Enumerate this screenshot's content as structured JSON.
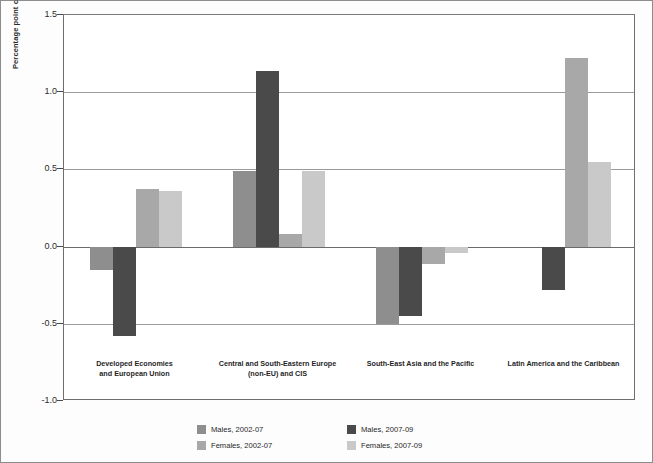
{
  "chart_data": {
    "type": "bar",
    "title": "",
    "subtitle": "",
    "xlabel": "",
    "ylabel": "Percentage point change in labour force participation rate",
    "ylim": [
      -1.0,
      1.5
    ],
    "yticks": [
      1.5,
      1.0,
      0.5,
      0.0,
      -0.5,
      -1.0
    ],
    "ytick_labels": [
      "1.5",
      "1.0",
      "0.5",
      "0.0",
      "-0.5",
      "-1.0"
    ],
    "grid": true,
    "legend_position": "bottom",
    "categories": [
      "Developed Economies\nand European Union",
      "Central and South-Eastern Europe\n(non-EU) and CIS",
      "South-East Asia and the Pacific",
      "Latin America and the Caribbean"
    ],
    "series": [
      {
        "name": "Males, 2002-07",
        "color": "#8e8e8e",
        "values": [
          -0.15,
          0.49,
          -0.5,
          0.0
        ]
      },
      {
        "name": "Males, 2007-09",
        "color": "#4a4a4a",
        "values": [
          -0.58,
          1.14,
          -0.45,
          -0.28
        ]
      },
      {
        "name": "Females, 2002-07",
        "color": "#a8a8a8",
        "values": [
          0.37,
          0.08,
          -0.11,
          1.22
        ]
      },
      {
        "name": "Females, 2007-09",
        "color": "#c9c9c9",
        "values": [
          0.36,
          0.49,
          -0.04,
          0.55
        ]
      }
    ]
  },
  "legend": {
    "items": [
      {
        "label": "Males, 2002-07"
      },
      {
        "label": "Males, 2007-09"
      },
      {
        "label": "Females, 2002-07"
      },
      {
        "label": "Females, 2007-09"
      }
    ]
  }
}
